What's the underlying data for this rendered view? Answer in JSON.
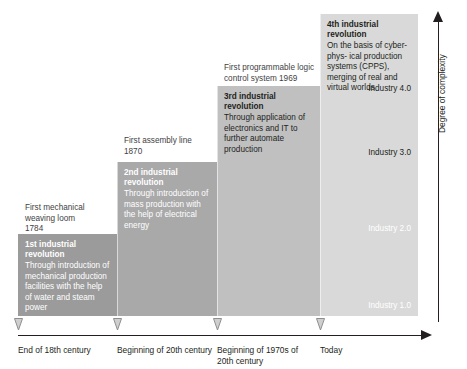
{
  "diagram": {
    "y_axis": {
      "label": "Degree of complexity"
    },
    "x_axis": {
      "ticks": [
        {
          "label": "End of 18th century"
        },
        {
          "label": "Beginning of 20th century"
        },
        {
          "label": "Beginning of 1970s of\n20th century"
        },
        {
          "label": "Today"
        }
      ]
    },
    "steps": [
      {
        "id": "industry-1",
        "caption": "First mechanical\nweaving loom\n1784",
        "title": "1st industrial revolution",
        "body": "Through introduction of\nmechanical production\nfacilities with the help of\nwater and steam power",
        "industry_label": "Industry 1.0",
        "color": "#9b9b9b",
        "text_color": "#ffffff"
      },
      {
        "id": "industry-2",
        "caption": "First assembly line\n1870",
        "title": "2nd industrial revolution",
        "body": "Through introduction of\nmass production with the\nhelp of electrical energy",
        "industry_label": "Industry 2.0",
        "color": "#a9a9a9",
        "text_color": "#ffffff"
      },
      {
        "id": "industry-3",
        "caption": "First programmable logic\ncontrol system 1969",
        "title": "3rd industrial revolution",
        "body": "Through application of\nelectronics and IT to\nfurther automate\nproduction",
        "industry_label": "Industry 3.0",
        "color": "#c0c0c0",
        "text_color": "#231f20"
      },
      {
        "id": "industry-4",
        "caption": "",
        "title": "4th industrial revolution",
        "body": "On the basis of cyber-phys-\nical production systems\n(CPPS), merging of real\nand virtual worlds",
        "industry_label": "Industry 4.0",
        "color": "#d9d9d9",
        "text_color": "#231f20"
      }
    ]
  }
}
